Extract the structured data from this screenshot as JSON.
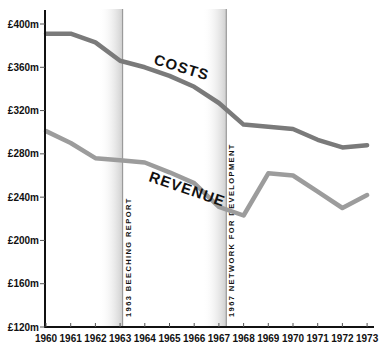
{
  "chart_data": {
    "type": "line",
    "title": "",
    "xlabel": "",
    "ylabel": "",
    "categories": [
      "1960",
      "1961",
      "1962",
      "1963",
      "1964",
      "1965",
      "1966",
      "1967",
      "1968",
      "1969",
      "1970",
      "1971",
      "1972",
      "1973"
    ],
    "series": [
      {
        "name": "COSTS",
        "color": "#7a7a7a",
        "values": [
          391,
          391,
          383,
          366,
          360,
          352,
          342,
          327,
          307,
          305,
          303,
          293,
          286,
          288
        ]
      },
      {
        "name": "REVENUE",
        "color": "#9c9c9c",
        "values": [
          301,
          290,
          276,
          274,
          272,
          263,
          253,
          231,
          223,
          262,
          260,
          245,
          230,
          242
        ]
      }
    ],
    "ylim": [
      120,
      400
    ],
    "yticks": [
      120,
      160,
      200,
      240,
      280,
      320,
      360,
      400
    ],
    "ytick_labels": [
      "£120m",
      "£160m",
      "£200m",
      "£240m",
      "£280m",
      "£320m",
      "£360m",
      "£400m"
    ],
    "grid": false,
    "legend": "inline labels",
    "annotations": [
      {
        "year": "1963",
        "position": 1963.1,
        "text": "1963 BEECHING REPORT"
      },
      {
        "year": "1967",
        "position": 1967.3,
        "text": "1967 NETWORK FOR DEVELOPMENT"
      }
    ]
  },
  "labels": {
    "costs": "COSTS",
    "revenue": "REVENUE"
  }
}
